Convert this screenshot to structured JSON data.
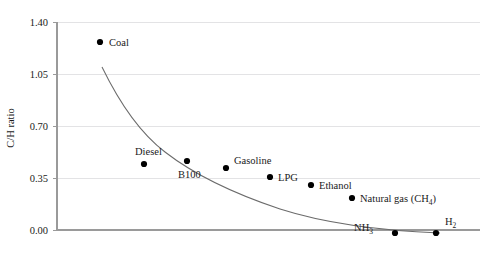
{
  "chart_data": {
    "type": "scatter",
    "title": "",
    "xlabel": "",
    "ylabel": "C/H ratio",
    "ylim": [
      0.0,
      1.4
    ],
    "yticks": [
      "0.00",
      "0.35",
      "0.70",
      "1.05",
      "1.40"
    ],
    "ytick_values": [
      0.0,
      0.35,
      0.7,
      1.05,
      1.4
    ],
    "xlim": [
      0,
      10
    ],
    "xticks": [],
    "grid": "horizontal",
    "legend": "none",
    "points": [
      {
        "label": "Coal",
        "label_html": "Coal",
        "x": 1.0,
        "y": 1.27,
        "px": 100,
        "py": 42,
        "label_dx": 9,
        "label_dy": 4
      },
      {
        "label": "Diesel",
        "label_html": "Diesel",
        "x": 2.0,
        "y": 0.445,
        "px": 144,
        "py": 164,
        "label_dx": -9,
        "label_dy": -9
      },
      {
        "label": "B100",
        "label_html": "B100",
        "x": 3.0,
        "y": 0.465,
        "px": 187,
        "py": 161,
        "label_dx": -9,
        "label_dy": 17
      },
      {
        "label": "Gasoline",
        "label_html": "Gasoline",
        "x": 4.0,
        "y": 0.42,
        "px": 226,
        "py": 168,
        "label_dx": 8,
        "label_dy": -4
      },
      {
        "label": "LPG",
        "label_html": "LPG",
        "x": 5.0,
        "y": 0.357,
        "px": 270,
        "py": 177,
        "label_dx": 8,
        "label_dy": 4
      },
      {
        "label": "Ethanol",
        "label_html": "Ethanol",
        "x": 6.0,
        "y": 0.303,
        "px": 311,
        "py": 185,
        "label_dx": 8,
        "label_dy": 4
      },
      {
        "label": "Natural gas (CH4)",
        "label_html": "Natural gas (CH<sub>4</sub>)",
        "x": 7.0,
        "y": 0.215,
        "px": 352,
        "py": 198,
        "label_dx": 8,
        "label_dy": 4
      },
      {
        "label": "NH3",
        "label_html": "NH<sub>3</sub>",
        "x": 8.0,
        "y": 0.0,
        "px": 395,
        "py": 233,
        "label_dx": -22,
        "label_dy": -2
      },
      {
        "label": "H2",
        "label_html": "H<sub>2</sub>",
        "x": 9.0,
        "y": 0.0,
        "px": 436,
        "py": 233,
        "label_dx": 9,
        "label_dy": -8
      }
    ],
    "trend_curve": {
      "description": "smooth decaying fit through the fuel series",
      "path": "M 102,67 C 120,104 140,133 165,152 C 196,176 232,193 280,209 C 330,225 390,231 440,233"
    },
    "colors": {
      "point": "#000000",
      "curve": "#6b6b6b",
      "grid": "#e3e3e5",
      "axis": "#9a9a9a",
      "text": "#1a1a1a",
      "background": "#ffffff"
    }
  },
  "axes": {
    "y_axis_title": "C/H ratio",
    "y_tick_labels": [
      "1.40",
      "1.05",
      "0.70",
      "0.35",
      "0.00"
    ],
    "y_tick_pixels": [
      22,
      74,
      126,
      178,
      230
    ],
    "plot_left": 57,
    "plot_right": 480,
    "plot_top": 22,
    "plot_bottom": 230
  }
}
